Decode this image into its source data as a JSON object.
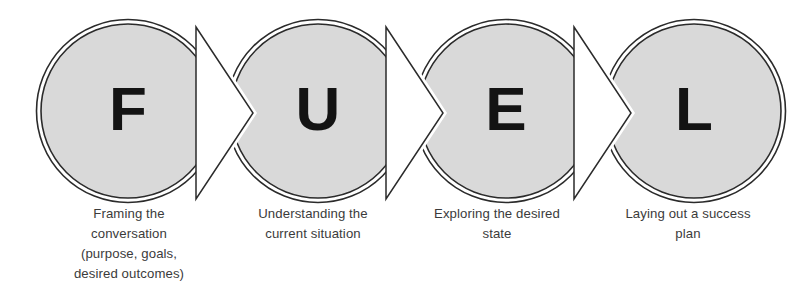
{
  "diagram": {
    "type": "process-flow-chevron-circles",
    "background_color": "#ffffff",
    "circle_fill": "#d9d9d9",
    "circle_stroke": "#2b2b2b",
    "letter_color": "#131313",
    "caption_color": "#3b3b3b",
    "connector_fill": "#ffffff",
    "steps": [
      {
        "letter": "F",
        "caption_lines": [
          "Framing the",
          "conversation",
          "(purpose, goals,",
          "desired outcomes)"
        ]
      },
      {
        "letter": "U",
        "caption_lines": [
          "Understanding the",
          "current situation"
        ]
      },
      {
        "letter": "E",
        "caption_lines": [
          "Exploring the desired",
          "state"
        ]
      },
      {
        "letter": "L",
        "caption_lines": [
          "Laying out a success",
          "plan"
        ]
      }
    ]
  }
}
